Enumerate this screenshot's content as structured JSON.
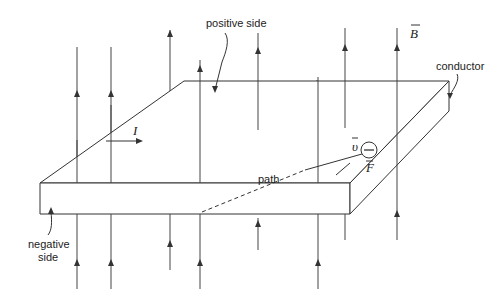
{
  "labels": {
    "positive_side": "positive side",
    "negative_side_line1": "negative",
    "negative_side_line2": "side",
    "conductor": "conductor",
    "path": "path",
    "magnetic_field": "B",
    "current": "I",
    "velocity": "υ",
    "force": "F",
    "electron_sign": "−"
  },
  "field_lines": [
    {
      "id": "f1",
      "segments": [
        "above",
        "below"
      ]
    },
    {
      "id": "f2",
      "segments": [
        "above",
        "below"
      ]
    },
    {
      "id": "f3",
      "segments": [
        "below"
      ]
    },
    {
      "id": "f4",
      "segments": [
        "above",
        "below"
      ]
    },
    {
      "id": "f5",
      "segments": [
        "above",
        "below"
      ]
    },
    {
      "id": "f6",
      "segments": [
        "below"
      ]
    },
    {
      "id": "f7",
      "segments": [
        "above",
        "below"
      ]
    },
    {
      "id": "f8",
      "segments": [
        "above"
      ]
    },
    {
      "id": "f9",
      "segments": [
        "above",
        "below"
      ]
    }
  ],
  "colors": {
    "stroke": "#333333",
    "background": "#ffffff"
  }
}
